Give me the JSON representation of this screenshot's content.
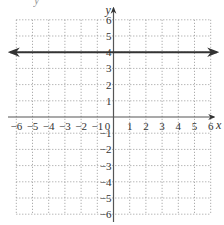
{
  "chart_data": {
    "type": "line",
    "title": "",
    "xlabel": "x",
    "ylabel": "y",
    "xlim": [
      -6,
      6
    ],
    "ylim": [
      -6,
      6
    ],
    "grid": true,
    "grid_style": "dotted",
    "x_ticks": [
      -6,
      -5,
      -4,
      -3,
      -2,
      -1,
      0,
      1,
      2,
      3,
      4,
      5,
      6
    ],
    "y_ticks": [
      -6,
      -5,
      -4,
      -3,
      -2,
      -1,
      1,
      2,
      3,
      4,
      5,
      6
    ],
    "x_tick_labels": [
      "−6",
      "−5",
      "−4",
      "−3",
      "−2",
      "−1",
      "0",
      "1",
      "2",
      "3",
      "4",
      "5",
      "6"
    ],
    "y_tick_labels": [
      "−6",
      "−5",
      "−4",
      "−3",
      "−2",
      "−1",
      "1",
      "2",
      "3",
      "4",
      "5",
      "6"
    ],
    "series": [
      {
        "name": "y = 4",
        "equation": "y = 4",
        "x": [
          -6.5,
          6.5
        ],
        "y": [
          4,
          4
        ],
        "arrows": "both",
        "color": "#333333"
      }
    ],
    "legend": null
  },
  "colors": {
    "axis": "#555555",
    "grid": "#999999",
    "line": "#333333"
  },
  "corner_label": "y"
}
